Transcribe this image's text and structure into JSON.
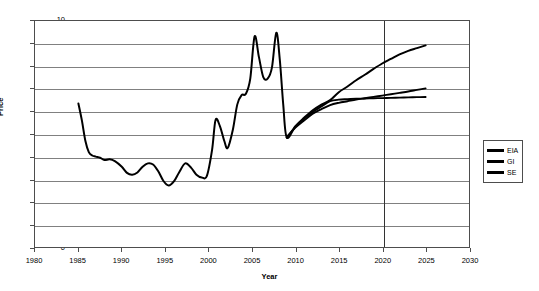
{
  "chart_data": {
    "type": "line",
    "title": "",
    "xlabel": "Year",
    "ylabel": "Price",
    "xlim": [
      1980,
      2030
    ],
    "ylim": [
      0,
      10
    ],
    "xticks": [
      "1980",
      "1985",
      "1990",
      "1995",
      "2000",
      "2005",
      "2010",
      "2015",
      "2020",
      "2025",
      "2030"
    ],
    "yticks": [
      "0",
      "1",
      "2",
      "3",
      "4",
      "5",
      "6",
      "7",
      "8",
      "9",
      "10"
    ],
    "grid": "horizontal",
    "legend_position": "right",
    "annotations": [
      {
        "type": "vertical-line",
        "x": 2020,
        "label": ""
      }
    ],
    "series": [
      {
        "name": "EIA",
        "color": "#000000",
        "x": [
          1985.0,
          1985.4,
          1985.8,
          1986.2,
          1986.6,
          1987.0,
          1987.5,
          1988.0,
          1988.6,
          1989.2,
          1990.0,
          1990.6,
          1991.2,
          1991.8,
          1992.4,
          1993.0,
          1993.6,
          1994.2,
          1994.8,
          1995.4,
          1996.0,
          1996.6,
          1997.3,
          1998.0,
          1998.6,
          1999.2,
          1999.8,
          2000.4,
          2000.8,
          2001.3,
          2001.8,
          2002.2,
          2002.8,
          2003.3,
          2003.8,
          2004.3,
          2004.8,
          2005.3,
          2005.8,
          2006.3,
          2006.8,
          2007.3,
          2007.8,
          2008.2,
          2008.6,
          2009.0,
          2010.0,
          2011.0,
          2012.0,
          2013.0,
          2014.0,
          2015.0,
          2016.0,
          2017.0,
          2018.0,
          2019.0,
          2020.0,
          2021.0,
          2022.0,
          2023.0,
          2024.0,
          2025.0
        ],
        "y": [
          6.35,
          5.6,
          4.7,
          4.2,
          4.05,
          4.0,
          3.95,
          3.85,
          3.88,
          3.8,
          3.55,
          3.28,
          3.2,
          3.3,
          3.55,
          3.7,
          3.65,
          3.35,
          2.92,
          2.72,
          2.9,
          3.3,
          3.7,
          3.5,
          3.2,
          3.08,
          3.15,
          4.3,
          5.62,
          5.35,
          4.7,
          4.38,
          5.2,
          6.3,
          6.72,
          6.78,
          7.45,
          9.32,
          8.4,
          7.52,
          7.45,
          7.95,
          9.48,
          8.3,
          6.3,
          4.85,
          5.35,
          5.72,
          6.05,
          6.3,
          6.5,
          6.85,
          7.1,
          7.38,
          7.62,
          7.88,
          8.12,
          8.32,
          8.52,
          8.68,
          8.8,
          8.92
        ],
        "note": "Historical series 1985-2009 then EIA forecast to 2025"
      },
      {
        "name": "GI",
        "color": "#262626",
        "x": [
          2009.0,
          2010.0,
          2011.0,
          2012.0,
          2013.0,
          2014.0,
          2015.0,
          2016.0,
          2017.0,
          2018.0,
          2019.0,
          2020.0,
          2021.0,
          2022.0,
          2023.0,
          2024.0,
          2025.0
        ],
        "y": [
          4.85,
          5.28,
          5.6,
          5.9,
          6.1,
          6.28,
          6.38,
          6.45,
          6.52,
          6.58,
          6.64,
          6.7,
          6.76,
          6.82,
          6.88,
          6.95,
          7.02
        ],
        "note": "GI forecast 2009-2025"
      },
      {
        "name": "SE",
        "color": "#1a1a1a",
        "x": [
          2009.0,
          2010.0,
          2011.0,
          2012.0,
          2013.0,
          2014.0,
          2015.0,
          2016.0,
          2017.0,
          2018.0,
          2019.0,
          2020.0,
          2021.0,
          2022.0,
          2023.0,
          2024.0,
          2025.0
        ],
        "y": [
          4.85,
          5.32,
          5.68,
          5.98,
          6.22,
          6.45,
          6.52,
          6.54,
          6.56,
          6.57,
          6.58,
          6.59,
          6.6,
          6.61,
          6.62,
          6.63,
          6.64
        ],
        "note": "SE forecast 2009-2025"
      }
    ]
  },
  "legend": {
    "items": [
      {
        "label": "EIA"
      },
      {
        "label": "GI"
      },
      {
        "label": "SE"
      }
    ]
  }
}
